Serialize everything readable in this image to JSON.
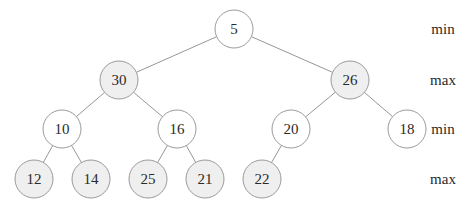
{
  "diagram": {
    "type": "min-max heap tree",
    "node_radius": 19,
    "colors": {
      "min_fill": "#ffffff",
      "max_fill": "#efefef",
      "stroke": "#8e8e8e",
      "edge": "#8a8a8a"
    },
    "levels": [
      {
        "label": "min",
        "y": 29
      },
      {
        "label": "max",
        "y": 80
      },
      {
        "label": "min",
        "y": 129
      },
      {
        "label": "max",
        "y": 179
      }
    ],
    "label_x": 443,
    "nodes": [
      {
        "id": "n0",
        "value": "5",
        "x": 234,
        "y": 29,
        "level": 0,
        "kind": "min"
      },
      {
        "id": "n1",
        "value": "30",
        "x": 119,
        "y": 80,
        "level": 1,
        "kind": "max"
      },
      {
        "id": "n2",
        "value": "26",
        "x": 350,
        "y": 80,
        "level": 1,
        "kind": "max"
      },
      {
        "id": "n3",
        "value": "10",
        "x": 62,
        "y": 129,
        "level": 2,
        "kind": "min"
      },
      {
        "id": "n4",
        "value": "16",
        "x": 177,
        "y": 129,
        "level": 2,
        "kind": "min"
      },
      {
        "id": "n5",
        "value": "20",
        "x": 291,
        "y": 129,
        "level": 2,
        "kind": "min"
      },
      {
        "id": "n6",
        "value": "18",
        "x": 407,
        "y": 129,
        "level": 2,
        "kind": "min"
      },
      {
        "id": "n7",
        "value": "12",
        "x": 34,
        "y": 179,
        "level": 3,
        "kind": "max"
      },
      {
        "id": "n8",
        "value": "14",
        "x": 91,
        "y": 179,
        "level": 3,
        "kind": "max"
      },
      {
        "id": "n9",
        "value": "25",
        "x": 148,
        "y": 179,
        "level": 3,
        "kind": "max"
      },
      {
        "id": "n10",
        "value": "21",
        "x": 205,
        "y": 179,
        "level": 3,
        "kind": "max"
      },
      {
        "id": "n11",
        "value": "22",
        "x": 262,
        "y": 179,
        "level": 3,
        "kind": "max"
      }
    ],
    "edges": [
      [
        "n0",
        "n1"
      ],
      [
        "n0",
        "n2"
      ],
      [
        "n1",
        "n3"
      ],
      [
        "n1",
        "n4"
      ],
      [
        "n2",
        "n5"
      ],
      [
        "n2",
        "n6"
      ],
      [
        "n3",
        "n7"
      ],
      [
        "n3",
        "n8"
      ],
      [
        "n4",
        "n9"
      ],
      [
        "n4",
        "n10"
      ],
      [
        "n5",
        "n11"
      ]
    ]
  }
}
